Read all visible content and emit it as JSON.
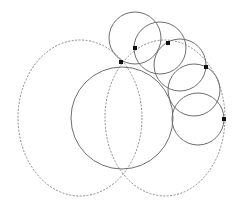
{
  "diagram": {
    "width": 236,
    "height": 205,
    "background": "#ffffff",
    "stroke_color": "#6e6e6e",
    "dashed_color": "#8a8a8a",
    "dot_color": "#111111",
    "main_circle": {
      "cx": 122,
      "cy": 118,
      "r": 51
    },
    "dashed_ellipses": [
      {
        "name": "left-dashed-ellipse",
        "cx": 80,
        "cy": 118,
        "rx": 62,
        "ry": 78
      },
      {
        "name": "right-dashed-ellipse",
        "cx": 165,
        "cy": 118,
        "rx": 60,
        "ry": 78
      }
    ],
    "small_circles": [
      {
        "cx": 135,
        "cy": 38,
        "r": 26
      },
      {
        "cx": 160,
        "cy": 48,
        "r": 26
      },
      {
        "cx": 180,
        "cy": 65,
        "r": 26
      },
      {
        "cx": 194,
        "cy": 90,
        "r": 26
      },
      {
        "cx": 198,
        "cy": 119,
        "r": 26
      }
    ],
    "points": [
      {
        "x": 121,
        "y": 62
      },
      {
        "x": 135,
        "y": 48
      },
      {
        "x": 168,
        "y": 43
      },
      {
        "x": 206,
        "y": 67
      },
      {
        "x": 224,
        "y": 119
      }
    ]
  }
}
